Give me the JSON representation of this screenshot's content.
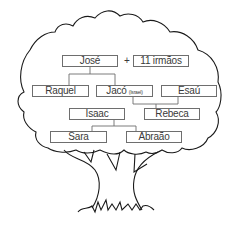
{
  "diagram": {
    "type": "family-tree",
    "colors": {
      "outline": "#1a1a1a",
      "box_border": "#6e6e6e",
      "text": "#3a3a3a",
      "background": "#ffffff"
    },
    "plus_sign": "+",
    "people": {
      "jose": {
        "name": "José"
      },
      "irmaos": {
        "name": "11 irmãos"
      },
      "raquel": {
        "name": "Raquel"
      },
      "jaco": {
        "name": "Jacó",
        "note": "(Israel)"
      },
      "esau": {
        "name": "Esaú"
      },
      "isaac": {
        "name": "Isaac"
      },
      "rebeca": {
        "name": "Rebeca"
      },
      "sara": {
        "name": "Sara"
      },
      "abraao": {
        "name": "Abraão"
      }
    },
    "relations": [
      {
        "parents": [
          "Raquel",
          "Jacó"
        ],
        "children": [
          "José",
          "11 irmãos"
        ]
      },
      {
        "parents": [
          "Isaac",
          "Rebeca"
        ],
        "children": [
          "Jacó",
          "Esaú"
        ]
      },
      {
        "parents": [
          "Sara",
          "Abraão"
        ],
        "children": [
          "Isaac"
        ]
      }
    ]
  }
}
